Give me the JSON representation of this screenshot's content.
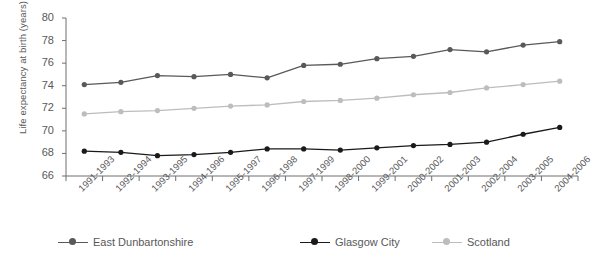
{
  "chart_data": {
    "type": "line",
    "title": "",
    "xlabel": "",
    "ylabel": "Life expectancy at birth (years)",
    "ylim": [
      66,
      80
    ],
    "ytick_step": 2,
    "yticks": [
      66,
      68,
      70,
      72,
      74,
      76,
      78,
      80
    ],
    "grid": false,
    "legend_position": "bottom",
    "categories": [
      "1991-1993",
      "1992-1994",
      "1993-1995",
      "1994-1996",
      "1995-1997",
      "1996-1998",
      "1997-1999",
      "1998-2000",
      "1999-2001",
      "2000-2002",
      "2001-2003",
      "2002-2004",
      "2003-2005",
      "2004-2006"
    ],
    "series": [
      {
        "name": "East Dunbartonshire",
        "color": "#595959",
        "values": [
          74.1,
          74.3,
          74.9,
          74.8,
          75.0,
          74.7,
          75.8,
          75.9,
          76.4,
          76.6,
          77.2,
          77.0,
          77.6,
          77.9
        ]
      },
      {
        "name": "Glasgow City",
        "color": "#1a1a1a",
        "values": [
          68.2,
          68.1,
          67.8,
          67.9,
          68.1,
          68.4,
          68.4,
          68.3,
          68.5,
          68.7,
          68.8,
          69.0,
          69.7,
          70.3
        ]
      },
      {
        "name": "Scotland",
        "color": "#bdbdbd",
        "values": [
          71.5,
          71.7,
          71.8,
          72.0,
          72.2,
          72.3,
          72.6,
          72.7,
          72.9,
          73.2,
          73.4,
          73.8,
          74.1,
          74.4
        ]
      }
    ]
  },
  "legend": {
    "items": [
      {
        "label": "East Dunbartonshire"
      },
      {
        "label": "Glasgow City"
      },
      {
        "label": "Scotland"
      }
    ]
  }
}
